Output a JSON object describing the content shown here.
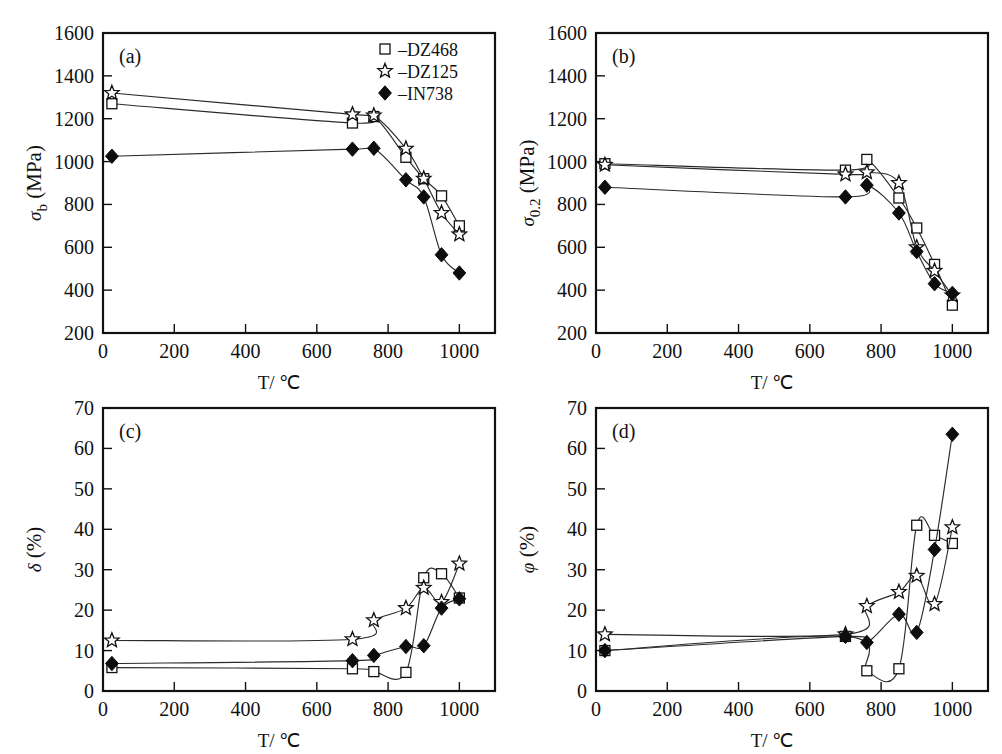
{
  "figure": {
    "background": "#ffffff",
    "ink": "#111111",
    "xlabel": "T/ ℃",
    "legend": {
      "items": [
        {
          "marker": "open-square",
          "label": "–DZ468",
          "series": "DZ468"
        },
        {
          "marker": "open-star",
          "label": "–DZ125",
          "series": "DZ125"
        },
        {
          "marker": "solid-diamond",
          "label": "–IN738",
          "series": "IN738"
        }
      ],
      "position": "panel-a-top-right"
    }
  },
  "chart_data": [
    {
      "type": "line",
      "panel": "a",
      "panel_label": "(a)",
      "title": "",
      "xlabel": "T/ ℃",
      "ylabel": "σ_b (MPa)",
      "ylabel_parts": {
        "symbol": "σ",
        "sub": "b",
        "unit": "(MPa)"
      },
      "xlim": [
        0,
        1100
      ],
      "ylim": [
        200,
        1600
      ],
      "xticks": [
        0,
        200,
        400,
        600,
        800,
        1000
      ],
      "yticks": [
        200,
        400,
        600,
        800,
        1000,
        1200,
        1400,
        1600
      ],
      "grid": false,
      "series": [
        {
          "name": "DZ468",
          "marker": "open-square",
          "x": [
            25,
            700,
            760,
            850,
            900,
            950,
            1000
          ],
          "y": [
            1270,
            1180,
            1210,
            1020,
            920,
            840,
            700
          ]
        },
        {
          "name": "DZ125",
          "marker": "open-star",
          "x": [
            25,
            700,
            760,
            850,
            900,
            950,
            1000
          ],
          "y": [
            1320,
            1220,
            1215,
            1060,
            920,
            760,
            660
          ]
        },
        {
          "name": "IN738",
          "marker": "solid-diamond",
          "x": [
            25,
            700,
            760,
            850,
            900,
            950,
            1000
          ],
          "y": [
            1025,
            1058,
            1062,
            915,
            835,
            565,
            480
          ]
        }
      ]
    },
    {
      "type": "line",
      "panel": "b",
      "panel_label": "(b)",
      "title": "",
      "xlabel": "T/ ℃",
      "ylabel": "σ_0.2 (MPa)",
      "ylabel_parts": {
        "symbol": "σ",
        "sub": "0.2",
        "unit": "(MPa)"
      },
      "xlim": [
        0,
        1100
      ],
      "ylim": [
        200,
        1600
      ],
      "xticks": [
        0,
        200,
        400,
        600,
        800,
        1000
      ],
      "yticks": [
        200,
        400,
        600,
        800,
        1000,
        1200,
        1400,
        1600
      ],
      "grid": false,
      "series": [
        {
          "name": "DZ468",
          "marker": "open-square",
          "x": [
            25,
            700,
            760,
            850,
            900,
            950,
            1000
          ],
          "y": [
            990,
            960,
            1010,
            830,
            690,
            520,
            330
          ]
        },
        {
          "name": "DZ125",
          "marker": "open-star",
          "x": [
            25,
            700,
            760,
            850,
            900,
            950,
            1000
          ],
          "y": [
            985,
            940,
            950,
            900,
            600,
            490,
            375
          ]
        },
        {
          "name": "IN738",
          "marker": "solid-diamond",
          "x": [
            25,
            700,
            760,
            850,
            900,
            950,
            1000
          ],
          "y": [
            880,
            835,
            890,
            760,
            580,
            430,
            385
          ]
        }
      ]
    },
    {
      "type": "line",
      "panel": "c",
      "panel_label": "(c)",
      "title": "",
      "xlabel": "T/ ℃",
      "ylabel": "δ (%)",
      "ylabel_parts": {
        "symbol": "δ",
        "sub": "",
        "unit": "(%)"
      },
      "xlim": [
        0,
        1100
      ],
      "ylim": [
        0,
        70
      ],
      "xticks": [
        0,
        200,
        400,
        600,
        800,
        1000
      ],
      "yticks": [
        0,
        10,
        20,
        30,
        40,
        50,
        60,
        70
      ],
      "grid": false,
      "series": [
        {
          "name": "DZ468",
          "marker": "open-square",
          "x": [
            25,
            700,
            760,
            850,
            900,
            950,
            1000
          ],
          "y": [
            5.8,
            5.5,
            4.8,
            4.6,
            28.0,
            29.0,
            23.0
          ]
        },
        {
          "name": "DZ125",
          "marker": "open-star",
          "x": [
            25,
            700,
            760,
            850,
            900,
            950,
            1000
          ],
          "y": [
            12.5,
            12.8,
            17.5,
            20.5,
            25.5,
            22.0,
            31.5
          ]
        },
        {
          "name": "IN738",
          "marker": "solid-diamond",
          "x": [
            25,
            700,
            760,
            850,
            900,
            950,
            1000
          ],
          "y": [
            6.8,
            7.5,
            8.8,
            11.0,
            11.2,
            20.5,
            22.8
          ]
        }
      ]
    },
    {
      "type": "line",
      "panel": "d",
      "panel_label": "(d)",
      "title": "",
      "xlabel": "T/ ℃",
      "ylabel": "φ (%)",
      "ylabel_parts": {
        "symbol": "φ",
        "sub": "",
        "unit": "(%)"
      },
      "xlim": [
        0,
        1100
      ],
      "ylim": [
        0,
        70
      ],
      "xticks": [
        0,
        200,
        400,
        600,
        800,
        1000
      ],
      "yticks": [
        0,
        10,
        20,
        30,
        40,
        50,
        60,
        70
      ],
      "grid": false,
      "series": [
        {
          "name": "DZ468",
          "marker": "open-square",
          "x": [
            25,
            700,
            760,
            850,
            900,
            950,
            1000
          ],
          "y": [
            10.0,
            13.5,
            5.0,
            5.5,
            41.0,
            38.5,
            36.5
          ]
        },
        {
          "name": "DZ125",
          "marker": "open-star",
          "x": [
            25,
            700,
            760,
            850,
            900,
            950,
            1000
          ],
          "y": [
            14.0,
            14.0,
            21.0,
            24.5,
            28.5,
            21.5,
            40.5
          ]
        },
        {
          "name": "IN738",
          "marker": "solid-diamond",
          "x": [
            25,
            700,
            760,
            850,
            900,
            950,
            1000
          ],
          "y": [
            10.0,
            13.5,
            12.0,
            19.0,
            14.5,
            35.0,
            63.5
          ]
        }
      ]
    }
  ]
}
